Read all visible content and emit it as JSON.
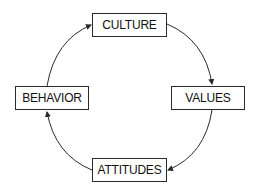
{
  "diagram": {
    "type": "cycle",
    "nodes": [
      {
        "id": "culture",
        "label": "CULTURE"
      },
      {
        "id": "values",
        "label": "VALUES"
      },
      {
        "id": "attitudes",
        "label": "ATTITUDES"
      },
      {
        "id": "behavior",
        "label": "BEHAVIOR"
      }
    ],
    "edges": [
      {
        "from": "culture",
        "to": "values"
      },
      {
        "from": "values",
        "to": "attitudes"
      },
      {
        "from": "attitudes",
        "to": "behavior"
      },
      {
        "from": "behavior",
        "to": "culture"
      }
    ],
    "colors": {
      "line": "#2a2a2a",
      "text": "#111111",
      "background": "#ffffff"
    }
  }
}
